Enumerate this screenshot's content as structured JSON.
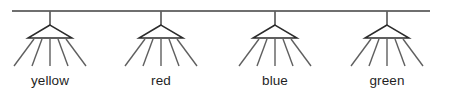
{
  "diagram": {
    "canvas": {
      "width": 449,
      "height": 110,
      "background": "#ffffff"
    },
    "ceiling": {
      "name": "ceiling-line",
      "x_start": 12,
      "x_end": 430,
      "y": 11,
      "color": "#6f6f6f",
      "thickness": 2.2
    },
    "style": {
      "rod_color": "#5e5e5e",
      "shade_color": "#2b2b2b",
      "ray_color": "#5f5f5f",
      "label_color": "#1f1f1f",
      "label_font_size": 13.5
    },
    "geometry": {
      "rod_top_y": 11,
      "shade_apex_y": 25,
      "shade_base_y": 38,
      "shade_half_width": 22,
      "ray_end_y": 66,
      "label_y": 85,
      "ray_offsets_top": [
        -16,
        -8,
        0,
        8,
        16
      ],
      "ray_offsets_bottom": [
        -36,
        -18,
        0,
        18,
        36
      ]
    },
    "lamps": [
      {
        "id": "lamp-yellow",
        "label": "yellow",
        "x": 50,
        "ray_count": 5
      },
      {
        "id": "lamp-red",
        "label": "red",
        "x": 161,
        "ray_count": 5
      },
      {
        "id": "lamp-blue",
        "label": "blue",
        "x": 275,
        "ray_count": 5
      },
      {
        "id": "lamp-green",
        "label": "green",
        "x": 387,
        "ray_count": 5
      }
    ]
  }
}
